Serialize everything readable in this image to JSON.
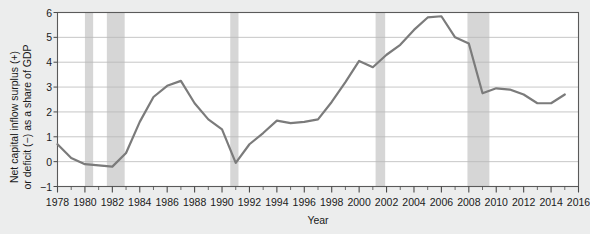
{
  "chart_data": {
    "type": "line",
    "title": "",
    "xlabel": "Year",
    "ylabel": "Net capital inflow surplus (+)\nor deficit (−) as a share of GDP",
    "xlim": [
      1978,
      2016
    ],
    "ylim": [
      -1,
      6
    ],
    "yticks": [
      -1,
      0,
      1,
      2,
      3,
      4,
      5,
      6
    ],
    "ytick_labels": [
      "−1",
      "0",
      "1",
      "2",
      "3",
      "4",
      "5",
      "6"
    ],
    "xticks": [
      1978,
      1980,
      1982,
      1984,
      1986,
      1988,
      1990,
      1992,
      1994,
      1996,
      1998,
      2000,
      2002,
      2004,
      2006,
      2008,
      2010,
      2012,
      2014,
      2016
    ],
    "xtick_labels": [
      "1978",
      "1980",
      "1982",
      "1984",
      "1986",
      "1988",
      "1990",
      "1992",
      "1994",
      "1996",
      "1998",
      "2000",
      "2002",
      "2004",
      "2006",
      "2008",
      "2010",
      "2012",
      "2014",
      "2016"
    ],
    "minor_xticks_interval": 1,
    "grid": "horizontal",
    "line_color": "#7b7b7b",
    "line_width": 2.2,
    "plot_background": "#ffffff",
    "figure_background": "#eceded",
    "recession_band_color": "#d6d6d6",
    "recession_bands": [
      {
        "start": 1980.0,
        "end": 1980.6
      },
      {
        "start": 1981.6,
        "end": 1982.9
      },
      {
        "start": 1990.6,
        "end": 1991.2
      },
      {
        "start": 2001.2,
        "end": 2001.9
      },
      {
        "start": 2007.9,
        "end": 2009.5
      }
    ],
    "x": [
      1978,
      1979,
      1980,
      1981,
      1982,
      1983,
      1984,
      1985,
      1986,
      1987,
      1988,
      1989,
      1990,
      1991,
      1992,
      1993,
      1994,
      1995,
      1996,
      1997,
      1998,
      1999,
      2000,
      2001,
      2002,
      2003,
      2004,
      2005,
      2006,
      2007,
      2008,
      2009,
      2010,
      2011,
      2012,
      2013,
      2014,
      2015
    ],
    "values": [
      0.7,
      0.15,
      -0.1,
      -0.15,
      -0.2,
      0.35,
      1.6,
      2.6,
      3.05,
      3.25,
      2.35,
      1.7,
      1.3,
      -0.05,
      0.7,
      1.15,
      1.65,
      1.55,
      1.6,
      1.7,
      2.4,
      3.2,
      4.05,
      3.8,
      4.3,
      4.7,
      5.3,
      5.8,
      5.85,
      5.0,
      4.75,
      2.75,
      2.95,
      2.9,
      2.7,
      2.35,
      2.35,
      2.7
    ],
    "series_name": "Net capital inflow as share of GDP"
  }
}
